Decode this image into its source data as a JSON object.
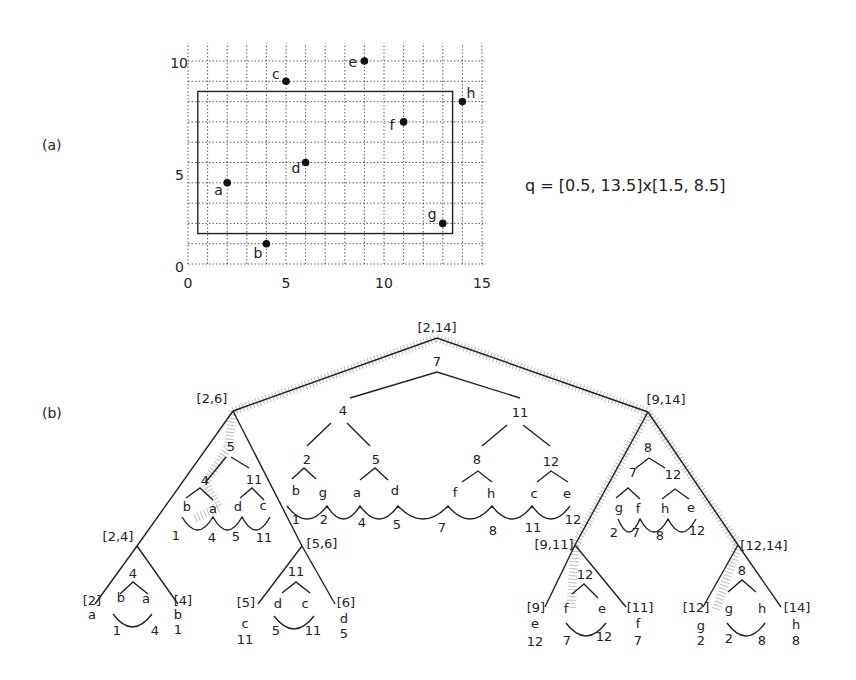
{
  "panel_a": {
    "label": "(a)",
    "query": "q = [0.5,  13.5]x[1.5, 8.5]",
    "x_ticks": [
      "0",
      "5",
      "10",
      "15"
    ],
    "y_ticks": [
      "0",
      "5",
      "10"
    ],
    "points": [
      {
        "name": "a",
        "x": 2,
        "y": 4
      },
      {
        "name": "b",
        "x": 4,
        "y": 1
      },
      {
        "name": "c",
        "x": 5,
        "y": 9
      },
      {
        "name": "d",
        "x": 6,
        "y": 5
      },
      {
        "name": "e",
        "x": 9,
        "y": 10
      },
      {
        "name": "f",
        "x": 11,
        "y": 7
      },
      {
        "name": "g",
        "x": 13,
        "y": 2
      },
      {
        "name": "h",
        "x": 14,
        "y": 8
      }
    ],
    "query_rect": {
      "x1": 0.5,
      "x2": 13.5,
      "y1": 1.5,
      "y2": 8.5
    }
  },
  "panel_b": {
    "label": "(b)",
    "nodes": {
      "root": "[2,14]",
      "l": "[2,6]",
      "r": "[9,14]",
      "ll": "[2,4]",
      "lr": "[5,6]",
      "rl": "[9,11]",
      "rr": "[12,14]",
      "lll": "[2]",
      "llr": "[4]",
      "lrl": "[5]",
      "lrr": "[6]",
      "rll": "[9]",
      "rlr": "[11]",
      "rrl": "[12]",
      "rrr": "[14]"
    },
    "leaf_points": {
      "lll": [
        "a"
      ],
      "llr": [
        "b",
        "1"
      ],
      "lrl": [
        "c",
        "11"
      ],
      "lrr": [
        "d",
        "5"
      ],
      "rll": [
        "e",
        "12"
      ],
      "rlr": [
        "f",
        "7"
      ],
      "rrl": [
        "g",
        "2"
      ],
      "rrr": [
        "h",
        "8"
      ]
    },
    "leaf_l_value": "a"
  },
  "chart_data": {
    "type": "scatter",
    "title": "",
    "xlabel": "",
    "ylabel": "",
    "xlim": [
      0,
      15
    ],
    "ylim": [
      0,
      10
    ],
    "grid": true,
    "x": [
      2,
      4,
      5,
      6,
      9,
      11,
      13,
      14
    ],
    "y": [
      4,
      1,
      9,
      5,
      10,
      7,
      2,
      8
    ],
    "labels": [
      "a",
      "b",
      "c",
      "d",
      "e",
      "f",
      "g",
      "h"
    ],
    "annotations": [
      "q = [0.5,  13.5]x[1.5, 8.5]"
    ]
  }
}
